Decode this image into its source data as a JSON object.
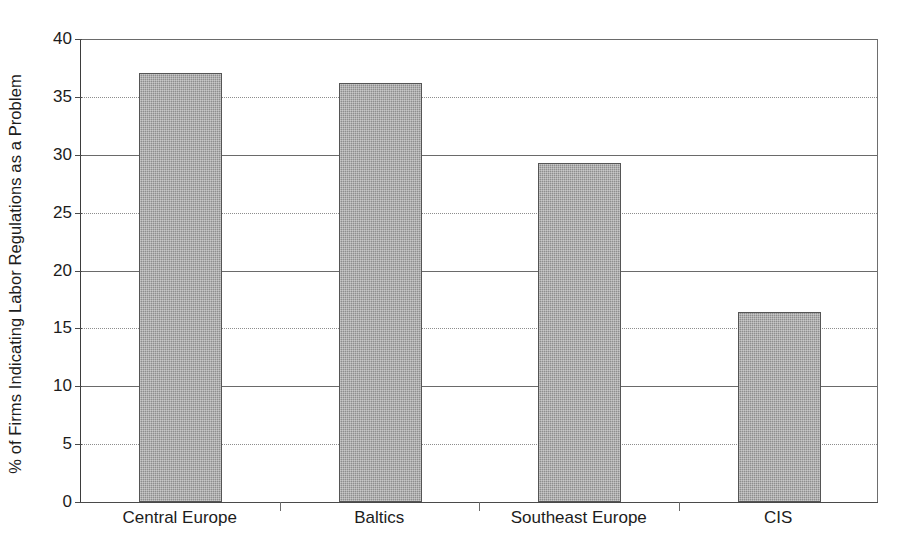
{
  "chart_data": {
    "type": "bar",
    "title": "",
    "xlabel": "",
    "ylabel": "% of Firms Indicating Labor Regulations as a Problem",
    "categories": [
      "Central Europe",
      "Baltics",
      "Southeast Europe",
      "CIS"
    ],
    "values": [
      37.1,
      36.2,
      29.3,
      16.4
    ],
    "ylim": [
      0,
      40
    ],
    "ytick_labels": [
      "0",
      "5",
      "10",
      "15",
      "20",
      "25",
      "30",
      "35",
      "40"
    ],
    "ytick_values": [
      0,
      5,
      10,
      15,
      20,
      25,
      30,
      35,
      40
    ],
    "grid": "horizontal",
    "legend": "none",
    "bar_fill_color": "#8e8e8e",
    "bar_edge_color": "#555555",
    "axis_color": "#4a4a4a",
    "gridline_color": "#7a7a7a",
    "background_color": "#ffffff"
  }
}
